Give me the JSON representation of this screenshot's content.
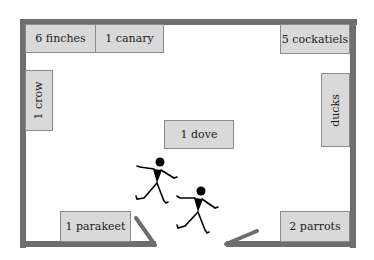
{
  "diagram": {
    "type": "room floor plan with bird cages and two walking people",
    "colors": {
      "wall": "#6e6e6e",
      "box_fill": "#d9d9d9",
      "box_border": "#8a8a8a",
      "figure": "#000000",
      "background": "#ffffff"
    },
    "boxes": [
      {
        "id": "finches",
        "label": "6 finches",
        "orientation": "horizontal"
      },
      {
        "id": "canary",
        "label": "1 canary",
        "orientation": "horizontal"
      },
      {
        "id": "cockatiels",
        "label": "5 cockatiels",
        "orientation": "horizontal"
      },
      {
        "id": "crow",
        "label": "1 crow",
        "orientation": "vertical"
      },
      {
        "id": "ducks",
        "label": "ducks",
        "orientation": "vertical"
      },
      {
        "id": "dove",
        "label": "1 dove",
        "orientation": "horizontal"
      },
      {
        "id": "parakeet",
        "label": "1 parakeet",
        "orientation": "horizontal"
      },
      {
        "id": "parrots",
        "label": "2 parrots",
        "orientation": "horizontal"
      }
    ],
    "figures": [
      {
        "id": "person-1",
        "description": "stick figure walking"
      },
      {
        "id": "person-2",
        "description": "stick figure walking"
      }
    ],
    "door": {
      "description": "double door opening in bottom wall"
    }
  }
}
